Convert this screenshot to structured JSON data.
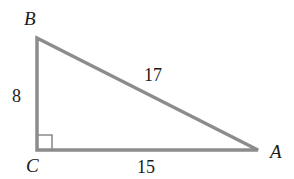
{
  "diagram": {
    "type": "right-triangle",
    "stroke_color": "#8c8c8c",
    "label_color": "#1a1a1a",
    "vertices": {
      "B": {
        "label": "B",
        "x": 37,
        "y": 38
      },
      "C": {
        "label": "C",
        "x": 37,
        "y": 150
      },
      "A": {
        "label": "A",
        "x": 258,
        "y": 150
      }
    },
    "sides": {
      "BC": {
        "label": "8"
      },
      "BA": {
        "label": "17"
      },
      "CA": {
        "label": "15"
      }
    },
    "right_angle_at": "C"
  }
}
